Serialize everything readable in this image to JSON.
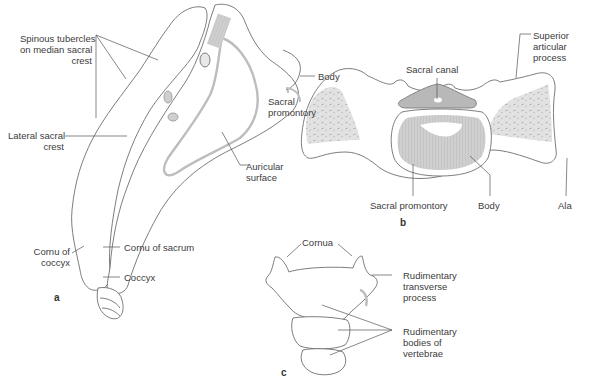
{
  "figure": {
    "panels": [
      {
        "id": "a",
        "letter": "a",
        "view": "lateral view of sacrum and coccyx",
        "labels": {
          "spinous_tubercles": "Spinous tubercles\non median sacral\ncrest",
          "lateral_sacral_crest": "Lateral sacral\ncrest",
          "body": "Body",
          "sacral_promontory": "Sacral\npromontory",
          "auricular_surface": "Auricular\nsurface",
          "cornu_of_coccyx": "Cornu of\ncoccyx",
          "cornu_of_sacrum": "Cornu of sacrum",
          "coccyx": "Coccyx"
        }
      },
      {
        "id": "b",
        "letter": "b",
        "view": "superior view of sacrum",
        "labels": {
          "sacral_canal": "Sacral canal",
          "superior_articular_process": "Superior\narticular\nprocess",
          "sacral_promontory": "Sacral promontory",
          "body": "Body",
          "ala": "Ala"
        }
      },
      {
        "id": "c",
        "letter": "c",
        "view": "coccyx",
        "labels": {
          "cornua": "Cornua",
          "rudimentary_transverse_process": "Rudimentary\ntransverse\nprocess",
          "rudimentary_bodies": "Rudimentary\nbodies of\nvertebrae"
        }
      }
    ],
    "colors": {
      "bone_fill": "#ffffff",
      "outline": "#6e6e6e",
      "shade": "#d4d4d4",
      "shade_dark": "#bdbdbd",
      "leader_line": "#555555"
    }
  }
}
